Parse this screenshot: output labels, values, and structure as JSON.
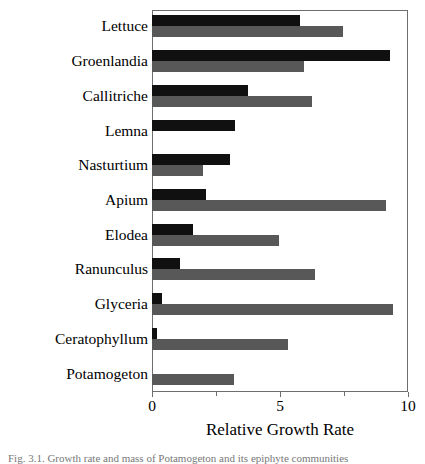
{
  "chart_data": {
    "type": "bar",
    "orientation": "horizontal",
    "title": "",
    "xlabel": "Relative Growth Rate",
    "ylabel": "",
    "xlim": [
      0,
      10
    ],
    "xticks": [
      0,
      2.5,
      5,
      7.5,
      10
    ],
    "xtick_labels": [
      "0",
      "",
      "5",
      "",
      "10"
    ],
    "grid": false,
    "legend": "none",
    "categories": [
      "Lettuce",
      "Groenlandia",
      "Callitriche",
      "Lemna",
      "Nasturtium",
      "Apium",
      "Elodea",
      "Ranunculus",
      "Glyceria",
      "Ceratophyllum",
      "Potamogeton"
    ],
    "series": [
      {
        "name": "dark",
        "color": "#101010",
        "values": [
          5.8,
          9.3,
          3.75,
          3.25,
          3.05,
          2.1,
          1.6,
          1.1,
          0.4,
          0.2,
          0
        ]
      },
      {
        "name": "light",
        "color": "#585858",
        "values": [
          7.45,
          5.95,
          6.25,
          0,
          2.0,
          9.15,
          4.95,
          6.35,
          9.4,
          5.3,
          3.2
        ]
      }
    ]
  },
  "axis": {
    "x_title": "Relative Growth Rate",
    "tick_labels": [
      "0",
      "5",
      "10"
    ]
  },
  "caption": {
    "text": "Fig. 3.1.  Growth rate and mass of Potamogeton and its epiphyte communities"
  },
  "colors": {
    "dark_bar": "#101010",
    "light_bar": "#585858",
    "frame": "#6e6e6e",
    "background": "#ffffff"
  }
}
